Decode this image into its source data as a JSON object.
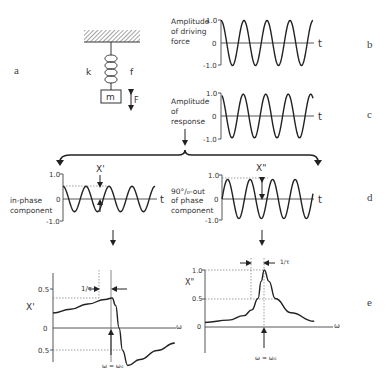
{
  "panels": {
    "a": "a",
    "b": "b",
    "c": "c",
    "d": "d",
    "e": "e"
  },
  "spring": {
    "k_label": "k",
    "f_label": "f",
    "mass_label": "m",
    "force_label": "F"
  },
  "driving": {
    "label_lines": [
      "Amplitude",
      "of driving",
      "force"
    ],
    "ticks": [
      "1.0",
      "0",
      "-1.0"
    ],
    "t_label": "t",
    "amplitude": 1.0,
    "cycles": 4
  },
  "response": {
    "label_lines": [
      "Amplitude",
      "of",
      "response"
    ],
    "ticks": [
      "1.0",
      "0",
      "-1.0"
    ],
    "t_label": "t",
    "amplitude": 0.95,
    "cycles": 4
  },
  "inphase": {
    "label_lines": [
      "in-phase",
      "component"
    ],
    "ticks": [
      "1.0",
      "0",
      "-1.0"
    ],
    "t_label": "t",
    "marker": "X'",
    "amplitude": 0.55
  },
  "outphase": {
    "label_lines": [
      "90°/₀-out",
      "of phase",
      "component"
    ],
    "ticks": [
      "1.0",
      "0",
      "-1.0"
    ],
    "t_label": "t",
    "marker": "X\"",
    "amplitude": 0.85
  },
  "chart_data": [
    {
      "type": "line",
      "title": "Amplitude of driving force",
      "xlabel": "t",
      "ylabel": "Amplitude of driving force",
      "ylim": [
        -1.0,
        1.0
      ],
      "yticks": [
        1.0,
        0,
        -1.0
      ],
      "series": [
        {
          "name": "driving force",
          "function": "cos",
          "amplitude": 1.0,
          "cycles": 4
        }
      ]
    },
    {
      "type": "line",
      "title": "Amplitude of response",
      "xlabel": "t",
      "ylabel": "Amplitude of response",
      "ylim": [
        -1.0,
        1.0
      ],
      "yticks": [
        1.0,
        0,
        -1.0
      ],
      "series": [
        {
          "name": "response",
          "function": "cos (phase-lagged)",
          "amplitude": 0.95,
          "cycles": 4
        }
      ]
    },
    {
      "type": "line",
      "title": "in-phase component",
      "xlabel": "t",
      "ylabel": "in-phase component",
      "ylim": [
        -1.0,
        1.0
      ],
      "yticks": [
        1.0,
        0,
        -1.0
      ],
      "series": [
        {
          "name": "X'",
          "function": "cos",
          "amplitude": 0.55,
          "cycles": 4
        }
      ]
    },
    {
      "type": "line",
      "title": "90° out of phase component",
      "xlabel": "t",
      "ylabel": "90° out of phase component",
      "ylim": [
        -1.0,
        1.0
      ],
      "yticks": [
        1.0,
        0,
        -1.0
      ],
      "series": [
        {
          "name": "X\"",
          "function": "sin",
          "amplitude": 0.85,
          "cycles": 4
        }
      ]
    },
    {
      "type": "line",
      "title": "X' vs ω",
      "xlabel": "ω",
      "ylabel": "X'",
      "yticks": [
        0.5,
        0,
        -0.5
      ],
      "annotations": [
        "1/τ",
        "ω = ω₀"
      ],
      "series": [
        {
          "name": "X'",
          "x": [
            0,
            0.2,
            0.4,
            0.6,
            0.68,
            0.72,
            0.76,
            0.8,
            0.86,
            1.0,
            1.2,
            1.4
          ],
          "values": [
            0.2,
            0.25,
            0.32,
            0.38,
            0.4,
            0.3,
            0.0,
            -0.3,
            -0.5,
            -0.42,
            -0.3,
            -0.2
          ]
        }
      ]
    },
    {
      "type": "line",
      "title": "X\" vs ω",
      "xlabel": "ω",
      "ylabel": "X\"",
      "yticks": [
        1.0,
        0.5,
        0
      ],
      "annotations": [
        "1/τ",
        "ω = ω₀"
      ],
      "series": [
        {
          "name": "X\"",
          "x": [
            0,
            0.3,
            0.5,
            0.6,
            0.68,
            0.72,
            0.76,
            0.82,
            0.9,
            1.1,
            1.4
          ],
          "values": [
            0.08,
            0.12,
            0.2,
            0.3,
            0.5,
            0.8,
            1.0,
            0.8,
            0.5,
            0.25,
            0.1
          ]
        }
      ]
    }
  ],
  "spectra": {
    "xprime": {
      "ylabel": "X'",
      "ticks": [
        "0.5",
        "0",
        "0.5"
      ],
      "x_label": "ω",
      "tau_label": "1/τ",
      "res_label": "ω = ω₀"
    },
    "xdouble": {
      "ylabel": "X\"",
      "ticks": [
        "1.0",
        "0.5",
        "0"
      ],
      "x_label": "ω",
      "tau_label": "1/τ",
      "res_label": "ω = ω₀"
    }
  }
}
